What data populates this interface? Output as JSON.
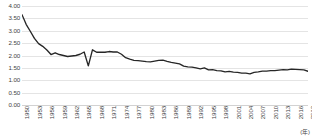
{
  "chart_data": {
    "type": "line",
    "title": "",
    "subtitle": "",
    "xlabel": "(年)",
    "ylabel": "",
    "grid": true,
    "legend": false,
    "legend_position": "none",
    "line_color": "#262626",
    "grid_color": "#e4e4e4",
    "axis_color": "#d2d2d2",
    "ylim": [
      0.0,
      4.0
    ],
    "xlim": [
      1950,
      2019
    ],
    "ytick_labels": [
      "0.00",
      "0.50",
      "1.00",
      "1.50",
      "2.00",
      "2.50",
      "3.00",
      "3.50",
      "4.00"
    ],
    "ytick_values": [
      0.0,
      0.5,
      1.0,
      1.5,
      2.0,
      2.5,
      3.0,
      3.5,
      4.0
    ],
    "xtick_labels": [
      "1950",
      "1953",
      "1956",
      "1959",
      "1962",
      "1965",
      "1968",
      "1971",
      "1974",
      "1977",
      "1980",
      "1983",
      "1986",
      "1989",
      "1992",
      "1995",
      "1998",
      "2001",
      "2004",
      "2007",
      "2010",
      "2013",
      "2016",
      "2019"
    ],
    "xtick_values": [
      1950,
      1953,
      1956,
      1959,
      1962,
      1965,
      1968,
      1971,
      1974,
      1977,
      1980,
      1983,
      1986,
      1989,
      1992,
      1995,
      1998,
      2001,
      2004,
      2007,
      2010,
      2013,
      2016,
      2019
    ],
    "x": [
      1950,
      1951,
      1952,
      1953,
      1954,
      1955,
      1956,
      1957,
      1958,
      1959,
      1960,
      1961,
      1962,
      1963,
      1964,
      1965,
      1966,
      1967,
      1968,
      1969,
      1970,
      1971,
      1972,
      1973,
      1974,
      1975,
      1976,
      1977,
      1978,
      1979,
      1980,
      1981,
      1982,
      1983,
      1984,
      1985,
      1986,
      1987,
      1988,
      1989,
      1990,
      1991,
      1992,
      1993,
      1994,
      1995,
      1996,
      1997,
      1998,
      1999,
      2000,
      2001,
      2002,
      2003,
      2004,
      2005,
      2006,
      2007,
      2008,
      2009,
      2010,
      2011,
      2012,
      2013,
      2014,
      2015,
      2016,
      2017,
      2018,
      2019
    ],
    "values": [
      3.65,
      3.26,
      2.98,
      2.69,
      2.48,
      2.37,
      2.22,
      2.04,
      2.11,
      2.04,
      2.0,
      1.96,
      1.98,
      2.0,
      2.05,
      2.14,
      1.58,
      2.23,
      2.13,
      2.13,
      2.13,
      2.16,
      2.14,
      2.14,
      2.05,
      1.91,
      1.85,
      1.8,
      1.79,
      1.77,
      1.75,
      1.74,
      1.77,
      1.8,
      1.81,
      1.76,
      1.72,
      1.69,
      1.66,
      1.57,
      1.54,
      1.53,
      1.5,
      1.46,
      1.5,
      1.42,
      1.43,
      1.39,
      1.38,
      1.34,
      1.36,
      1.33,
      1.32,
      1.29,
      1.29,
      1.26,
      1.32,
      1.34,
      1.37,
      1.37,
      1.39,
      1.39,
      1.41,
      1.43,
      1.42,
      1.45,
      1.44,
      1.43,
      1.42,
      1.36
    ],
    "series": [
      {
        "name": "合計特殊出生率",
        "values": [
          3.65,
          3.26,
          2.98,
          2.69,
          2.48,
          2.37,
          2.22,
          2.04,
          2.11,
          2.04,
          2.0,
          1.96,
          1.98,
          2.0,
          2.05,
          2.14,
          1.58,
          2.23,
          2.13,
          2.13,
          2.13,
          2.16,
          2.14,
          2.14,
          2.05,
          1.91,
          1.85,
          1.8,
          1.79,
          1.77,
          1.75,
          1.74,
          1.77,
          1.8,
          1.81,
          1.76,
          1.72,
          1.69,
          1.66,
          1.57,
          1.54,
          1.53,
          1.5,
          1.46,
          1.5,
          1.42,
          1.43,
          1.39,
          1.38,
          1.34,
          1.36,
          1.33,
          1.32,
          1.29,
          1.29,
          1.26,
          1.32,
          1.34,
          1.37,
          1.37,
          1.39,
          1.39,
          1.41,
          1.43,
          1.42,
          1.45,
          1.44,
          1.43,
          1.42,
          1.36
        ]
      }
    ],
    "annotations": []
  }
}
